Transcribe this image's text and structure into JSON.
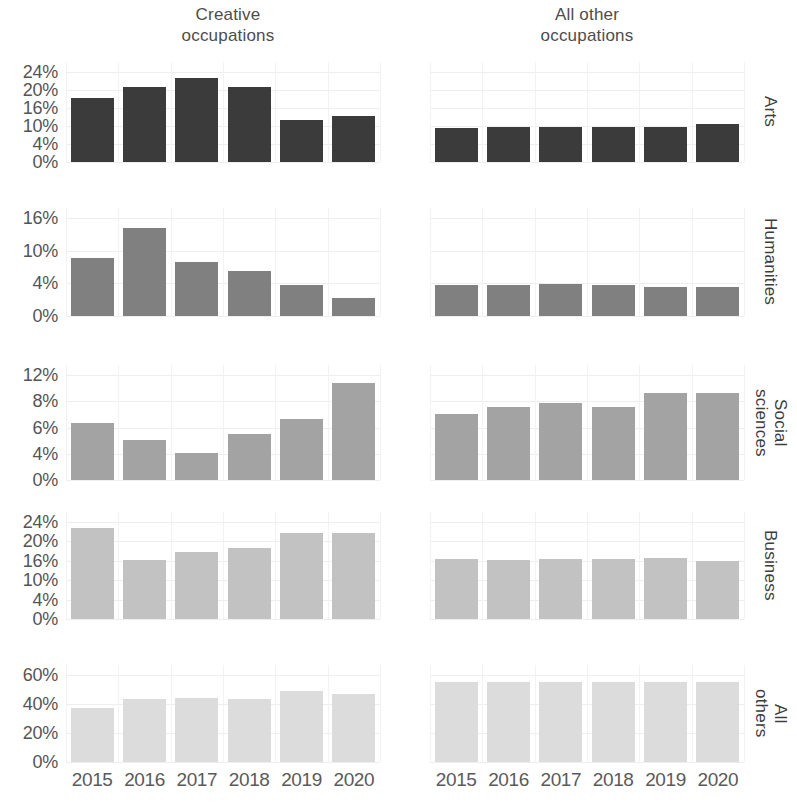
{
  "chart_data": {
    "type": "bar",
    "title": "",
    "subtitle": "",
    "xlabel": "",
    "ylabel": "",
    "grid": true,
    "legend_position": "none",
    "layout": "facet-grid 5 rows x 2 columns",
    "x": [
      "2015",
      "2016",
      "2017",
      "2018",
      "2019",
      "2020"
    ],
    "column_titles": [
      "Creative\noccupations",
      "All other\noccupations"
    ],
    "row_titles": [
      "Arts",
      "Humanities",
      "Social\nsciences",
      "Business",
      "All\nothers"
    ],
    "value_unit": "percent",
    "panels": [
      {
        "row": "Arts",
        "column": "Creative occupations",
        "color": "#3b3b3b",
        "yticks": [
          "24%",
          "20%",
          "16%",
          "10%",
          "4%",
          "0%"
        ],
        "ytick_values": [
          24,
          20,
          16,
          10,
          4,
          0
        ],
        "ylim": [
          0,
          26
        ],
        "categories": [
          "2015",
          "2016",
          "2017",
          "2018",
          "2019",
          "2020"
        ],
        "values": [
          18.5,
          21.8,
          24.4,
          21.8,
          12.0,
          13.2
        ]
      },
      {
        "row": "Arts",
        "column": "All other occupations",
        "color": "#3b3b3b",
        "yticks": [
          "24%",
          "20%",
          "16%",
          "10%",
          "4%",
          "0%"
        ],
        "ytick_values": [
          24,
          20,
          16,
          10,
          4,
          0
        ],
        "ylim": [
          0,
          26
        ],
        "categories": [
          "2015",
          "2016",
          "2017",
          "2018",
          "2019",
          "2020"
        ],
        "values": [
          9.8,
          10.0,
          10.0,
          10.1,
          10.2,
          11.0
        ]
      },
      {
        "row": "Humanities",
        "column": "Creative occupations",
        "color": "#808080",
        "yticks": [
          "16%",
          "10%",
          "4%",
          "0%"
        ],
        "ytick_values": [
          16,
          10,
          4,
          0
        ],
        "ylim": [
          0,
          17.5
        ],
        "categories": [
          "2015",
          "2016",
          "2017",
          "2018",
          "2019",
          "2020"
        ],
        "values": [
          10.3,
          15.7,
          9.7,
          8.0,
          5.6,
          3.2
        ]
      },
      {
        "row": "Humanities",
        "column": "All other occupations",
        "color": "#808080",
        "yticks": [
          "16%",
          "10%",
          "4%",
          "0%"
        ],
        "ytick_values": [
          16,
          10,
          4,
          0
        ],
        "ylim": [
          0,
          17.5
        ],
        "categories": [
          "2015",
          "2016",
          "2017",
          "2018",
          "2019",
          "2020"
        ],
        "values": [
          5.5,
          5.6,
          5.8,
          5.6,
          5.2,
          5.2
        ]
      },
      {
        "row": "Social sciences",
        "column": "Creative occupations",
        "color": "#a3a3a3",
        "yticks": [
          "12%",
          "8%",
          "6%",
          "4%",
          "0%"
        ],
        "ytick_values": [
          12,
          8,
          6,
          4,
          0
        ],
        "ylim": [
          0,
          13
        ],
        "categories": [
          "2015",
          "2016",
          "2017",
          "2018",
          "2019",
          "2020"
        ],
        "values": [
          7.0,
          4.9,
          3.4,
          5.7,
          7.6,
          12.0
        ]
      },
      {
        "row": "Social sciences",
        "column": "All other occupations",
        "color": "#a3a3a3",
        "yticks": [
          "12%",
          "8%",
          "6%",
          "4%",
          "0%"
        ],
        "ytick_values": [
          12,
          8,
          6,
          4,
          0
        ],
        "ylim": [
          0,
          13
        ],
        "categories": [
          "2015",
          "2016",
          "2017",
          "2018",
          "2019",
          "2020"
        ],
        "values": [
          8.2,
          9.0,
          9.5,
          9.0,
          10.8,
          10.8
        ]
      },
      {
        "row": "Business",
        "column": "Creative occupations",
        "color": "#c2c2c2",
        "yticks": [
          "24%",
          "20%",
          "16%",
          "10%",
          "4%",
          "0%"
        ],
        "ytick_values": [
          24,
          20,
          16,
          10,
          4,
          0
        ],
        "ylim": [
          0,
          25.5
        ],
        "categories": [
          "2015",
          "2016",
          "2017",
          "2018",
          "2019",
          "2020"
        ],
        "values": [
          24.0,
          15.5,
          17.5,
          18.8,
          22.5,
          22.5
        ]
      },
      {
        "row": "Business",
        "column": "All other occupations",
        "color": "#c2c2c2",
        "yticks": [
          "24%",
          "20%",
          "16%",
          "10%",
          "4%",
          "0%"
        ],
        "ytick_values": [
          24,
          20,
          16,
          10,
          4,
          0
        ],
        "ylim": [
          0,
          25.5
        ],
        "categories": [
          "2015",
          "2016",
          "2017",
          "2018",
          "2019",
          "2020"
        ],
        "values": [
          15.8,
          15.5,
          15.8,
          15.8,
          16.0,
          15.3
        ]
      },
      {
        "row": "All others",
        "column": "Creative occupations",
        "color": "#dcdcdc",
        "yticks": [
          "60%",
          "40%",
          "20%",
          "0%"
        ],
        "ytick_values": [
          60,
          40,
          20,
          0
        ],
        "ylim": [
          0,
          64
        ],
        "categories": [
          "2015",
          "2016",
          "2017",
          "2018",
          "2019",
          "2020"
        ],
        "values": [
          40.0,
          46.0,
          47.0,
          46.0,
          52.0,
          50.0
        ]
      },
      {
        "row": "All others",
        "column": "All other occupations",
        "color": "#dcdcdc",
        "yticks": [
          "60%",
          "40%",
          "20%",
          "0%"
        ],
        "ytick_values": [
          60,
          40,
          20,
          0
        ],
        "ylim": [
          0,
          64
        ],
        "categories": [
          "2015",
          "2016",
          "2017",
          "2018",
          "2019",
          "2020"
        ],
        "values": [
          59.0,
          59.0,
          59.0,
          59.0,
          59.0,
          59.0
        ]
      }
    ]
  },
  "figure": {
    "column_titles": [
      {
        "line1": "Creative",
        "line2": "occupations"
      },
      {
        "line1": "All other",
        "line2": "occupations"
      }
    ],
    "row_labels": [
      "Arts",
      "Humanities",
      "Social\nsciences",
      "Business",
      "All\nothers"
    ],
    "x_labels": [
      "2015",
      "2016",
      "2017",
      "2018",
      "2019",
      "2020"
    ]
  }
}
